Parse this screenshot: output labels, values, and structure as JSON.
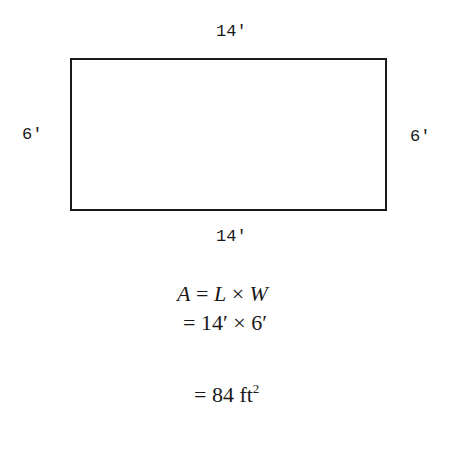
{
  "figure": {
    "shape": "rectangle",
    "labels": {
      "top": "14'",
      "bottom": "14'",
      "left": "6'",
      "right": "6'"
    }
  },
  "equations": {
    "line1": {
      "A": "A",
      "eq": " = ",
      "L": "L",
      "times": " × ",
      "W": "W"
    },
    "line2": "= 14′ × 6′",
    "line3": {
      "text": "= 84 ft",
      "exponent": "2"
    }
  }
}
